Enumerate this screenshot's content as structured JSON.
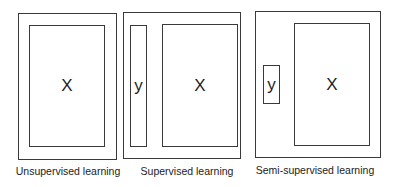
{
  "panels": [
    {
      "id": "unsupervised",
      "label": "Unsupervised learning",
      "x_symbol": "X"
    },
    {
      "id": "supervised",
      "label": "Supervised learning",
      "x_symbol": "X",
      "y_symbol": "y"
    },
    {
      "id": "semi-supervised",
      "label": "Semi-supervised learning",
      "x_symbol": "X",
      "y_symbol": "y"
    }
  ],
  "colors": {
    "line": "#3a3a3a",
    "background": "#ffffff",
    "text": "#222222"
  }
}
